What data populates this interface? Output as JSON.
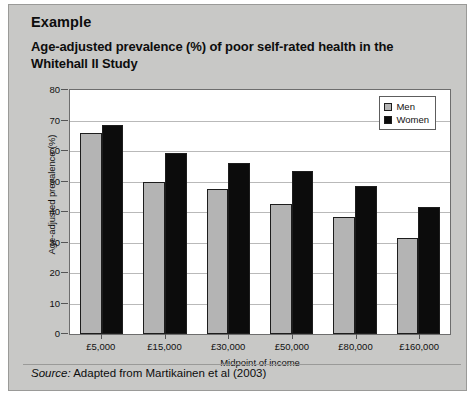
{
  "card": {
    "example_heading": "Example",
    "chart_title": "Age-adjusted prevalence (%) of poor self-rated health in the Whitehall II Study",
    "source_label": "Source:",
    "source_text": " Adapted from Martikainen et al (2003)"
  },
  "colors": {
    "card_background": "#c8c8c6",
    "plot_background": "#ffffff",
    "men_series": "#b4b4b4",
    "women_series": "#0c0c0c",
    "gridline": "#b9b9b9",
    "axis": "#6d6d6d",
    "text": "#111111"
  },
  "chart_data": {
    "type": "bar",
    "title": "Age-adjusted prevalence (%) of poor self-rated health in the Whitehall II Study",
    "xlabel": "Midpoint of income",
    "ylabel": "Age-adjusted prevalence (%)",
    "ylim": [
      0,
      80
    ],
    "ytick_step": 10,
    "yticks": [
      0,
      10,
      20,
      30,
      40,
      50,
      60,
      70,
      80
    ],
    "grid": true,
    "legend_position": "top-right",
    "categories": [
      "£5,000",
      "£15,000",
      "£30,000",
      "£50,000",
      "£80,000",
      "£160,000"
    ],
    "series": [
      {
        "name": "Men",
        "color": "#b4b4b4",
        "values": [
          66,
          50,
          47.5,
          42.5,
          38.5,
          31.5
        ]
      },
      {
        "name": "Women",
        "color": "#0c0c0c",
        "values": [
          68.5,
          59.5,
          56,
          53.5,
          48.5,
          41.5
        ]
      }
    ]
  }
}
